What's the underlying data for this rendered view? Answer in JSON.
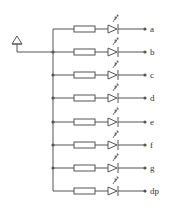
{
  "diagram": {
    "colors": {
      "line": "#555555",
      "background": "#ffffff"
    },
    "common_terminal": {
      "symbol": "triangle-terminal-icon",
      "label": ""
    },
    "segments": [
      {
        "id": "a",
        "label": "a"
      },
      {
        "id": "b",
        "label": "b"
      },
      {
        "id": "c",
        "label": "c"
      },
      {
        "id": "d",
        "label": "d"
      },
      {
        "id": "e",
        "label": "e"
      },
      {
        "id": "f",
        "label": "f"
      },
      {
        "id": "g",
        "label": "g"
      },
      {
        "id": "dp",
        "label": "dp"
      }
    ],
    "components_per_row": [
      "resistor",
      "led"
    ]
  }
}
